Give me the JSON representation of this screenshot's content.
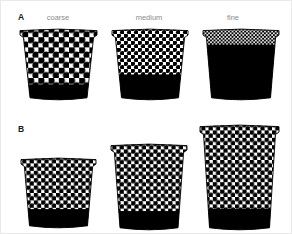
{
  "figure": {
    "background_color": "#ffffff",
    "ink_color": "#000000",
    "label_color": "#8b8b8b",
    "panel_letter_color": "#1b1b1b"
  },
  "panels": [
    {
      "letter": "A",
      "letter_x": 17,
      "letter_y": 12,
      "column_labels": [
        {
          "text": "coarse",
          "x": 57,
          "y": 13
        },
        {
          "text": "medium",
          "x": 148,
          "y": 13
        },
        {
          "text": "fine",
          "x": 232,
          "y": 13
        }
      ]
    },
    {
      "letter": "B",
      "letter_x": 17,
      "letter_y": 124,
      "column_labels": []
    }
  ],
  "pots": [
    {
      "id": "pot-a-coarse",
      "panel": "A",
      "label": "coarse",
      "x": 17,
      "y": 26,
      "width": 77,
      "height": 71,
      "top_width": 77,
      "bottom_width": 57,
      "rim_height": 7,
      "fill_fraction": 0.78,
      "dot_spacing": 10.2,
      "dot_radius": 3.5
    },
    {
      "id": "pot-a-medium",
      "panel": "A",
      "label": "medium",
      "x": 109,
      "y": 26,
      "width": 76,
      "height": 71,
      "top_width": 76,
      "bottom_width": 57,
      "rim_height": 7,
      "fill_fraction": 0.64,
      "dot_spacing": 7.0,
      "dot_radius": 2.3
    },
    {
      "id": "pot-a-fine",
      "panel": "A",
      "label": "fine",
      "x": 200,
      "y": 26,
      "width": 76,
      "height": 71,
      "top_width": 76,
      "bottom_width": 59,
      "rim_height": 7,
      "fill_fraction": 0.22,
      "dot_spacing": 3.6,
      "dot_radius": 1.15
    },
    {
      "id": "pot-b-small",
      "panel": "B",
      "label": "",
      "x": 18,
      "y": 155,
      "width": 75,
      "height": 70,
      "top_width": 75,
      "bottom_width": 58,
      "rim_height": 7,
      "fill_fraction": 0.73,
      "dot_spacing": 7.4,
      "dot_radius": 2.5
    },
    {
      "id": "pot-b-medium",
      "panel": "B",
      "label": "",
      "x": 108,
      "y": 141,
      "width": 76,
      "height": 86,
      "top_width": 76,
      "bottom_width": 58,
      "rim_height": 7,
      "fill_fraction": 0.78,
      "dot_spacing": 7.4,
      "dot_radius": 2.5
    },
    {
      "id": "pot-b-large",
      "panel": "B",
      "label": "",
      "x": 197,
      "y": 122,
      "width": 79,
      "height": 105,
      "top_width": 79,
      "bottom_width": 60,
      "rim_height": 8,
      "fill_fraction": 0.8,
      "dot_spacing": 7.4,
      "dot_radius": 2.5
    }
  ]
}
